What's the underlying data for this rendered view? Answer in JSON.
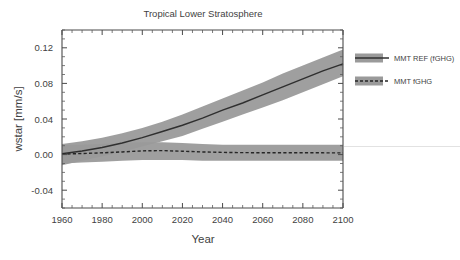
{
  "chart_data": {
    "type": "line",
    "title": "Tropical Lower Stratosphere",
    "xlabel": "Year",
    "ylabel": "wstar [mm/s]",
    "xlim": [
      1960,
      2100
    ],
    "ylim": [
      -0.06,
      0.14
    ],
    "xticks": [
      1960,
      1980,
      2000,
      2020,
      2040,
      2060,
      2080,
      2100
    ],
    "xtick_labels": [
      "1960",
      "1980",
      "2000",
      "2020",
      "2040",
      "2060",
      "2080",
      "2100"
    ],
    "x_minor_interval": 5,
    "yticks": [
      -0.04,
      0.0,
      0.04,
      0.08,
      0.12
    ],
    "ytick_labels": [
      "-0.04",
      "0.00",
      "0.04",
      "0.08",
      "0.12"
    ],
    "y_minor_interval": 0.01,
    "grid": false,
    "legend_position": "right-outside",
    "band_color": "#9a9a9a",
    "line_color": "#2f2f2f",
    "x": [
      1960,
      1970,
      1980,
      1990,
      2000,
      2010,
      2020,
      2030,
      2040,
      2050,
      2060,
      2070,
      2080,
      2090,
      2100
    ],
    "series": [
      {
        "name": "MMT REF (fGHG)",
        "style": "solid",
        "values": [
          0.001,
          0.004,
          0.008,
          0.013,
          0.019,
          0.026,
          0.033,
          0.041,
          0.05,
          0.058,
          0.067,
          0.076,
          0.085,
          0.094,
          0.102
        ],
        "band_lower": [
          -0.012,
          -0.007,
          -0.002,
          0.003,
          0.009,
          0.015,
          0.021,
          0.029,
          0.037,
          0.045,
          0.053,
          0.061,
          0.07,
          0.079,
          0.088
        ],
        "band_upper": [
          0.012,
          0.015,
          0.019,
          0.024,
          0.03,
          0.037,
          0.045,
          0.054,
          0.063,
          0.072,
          0.081,
          0.091,
          0.1,
          0.109,
          0.118
        ]
      },
      {
        "name": "MMT fGHG",
        "style": "dashed",
        "values": [
          0.0005,
          0.0012,
          0.002,
          0.003,
          0.0042,
          0.0045,
          0.0038,
          0.003,
          0.0025,
          0.0022,
          0.0021,
          0.0021,
          0.002,
          0.002,
          0.0019
        ],
        "band_lower": [
          -0.01,
          -0.009,
          -0.008,
          -0.007,
          -0.006,
          -0.006,
          -0.006,
          -0.007,
          -0.007,
          -0.007,
          -0.007,
          -0.007,
          -0.007,
          -0.007,
          -0.007
        ],
        "band_upper": [
          0.011,
          0.011,
          0.012,
          0.013,
          0.014,
          0.014,
          0.013,
          0.012,
          0.011,
          0.011,
          0.011,
          0.011,
          0.011,
          0.011,
          0.011
        ]
      }
    ],
    "legend": [
      {
        "label": "MMT REF (fGHG)",
        "style": "solid"
      },
      {
        "label": "MMT fGHG",
        "style": "dashed"
      }
    ]
  }
}
